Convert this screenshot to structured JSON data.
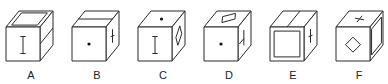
{
  "figure": {
    "stroke_color": "#2a2a2a",
    "background": "#ffffff"
  },
  "cubes": [
    {
      "label": "A",
      "front": "vertical-bar-I",
      "top": "inner-square-frame",
      "right": "horizontal-split-line"
    },
    {
      "label": "B",
      "front": "dot",
      "top": "horizontal-split-line",
      "right": "x-cross"
    },
    {
      "label": "C",
      "front": "vertical-bar-I",
      "top": "dot",
      "right": "tilted-square"
    },
    {
      "label": "D",
      "front": "dot",
      "top": "tilted-rectangle",
      "right": "t-mark"
    },
    {
      "label": "E",
      "front": "inner-square-frame",
      "top": "vertical-split-line",
      "right": "x-cross"
    },
    {
      "label": "F",
      "front": "diamond",
      "top": "x-cross",
      "right": "inner-frame"
    }
  ]
}
